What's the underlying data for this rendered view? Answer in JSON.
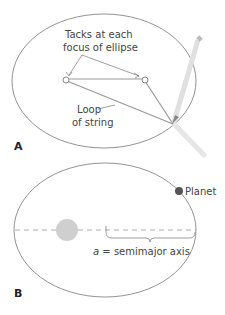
{
  "panel_a": {
    "label": "A",
    "callout_tacks_line1": "Tacks at each",
    "callout_tacks_line2": "focus of ellipse",
    "callout_loop_line1": "Loop",
    "callout_loop_line2": "of string"
  },
  "panel_b": {
    "label": "B",
    "planet_label": "Planet",
    "axis_label_var": "a",
    "axis_label_rest": " = semimajor axis"
  },
  "colors": {
    "ellipse_stroke": "#777777",
    "string": "#9a9a9a",
    "pencil": "#dddddd",
    "sun": "#c8c8c8",
    "planet": "#555555",
    "dashed_axis": "#999999"
  }
}
